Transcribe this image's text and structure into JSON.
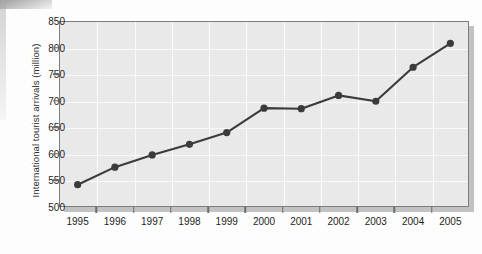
{
  "chart_data": {
    "type": "line",
    "title": "",
    "xlabel": "",
    "ylabel": "International tourist arrivals (million)",
    "categories": [
      "1995",
      "1996",
      "1997",
      "1998",
      "1999",
      "2000",
      "2001",
      "2002",
      "2003",
      "2004",
      "2005"
    ],
    "values": [
      542,
      575,
      598,
      618,
      640,
      686,
      685,
      710,
      699,
      763,
      808
    ],
    "series": [
      {
        "name": "International tourist arrivals",
        "values": [
          542,
          575,
          598,
          618,
          640,
          686,
          685,
          710,
          699,
          763,
          808
        ]
      }
    ],
    "ylim": [
      500,
      850
    ],
    "yticks": [
      500,
      550,
      600,
      650,
      700,
      750,
      800,
      850
    ],
    "ytick_labels": [
      "500",
      "550",
      "600",
      "650",
      "700",
      "750",
      "800",
      "850"
    ],
    "xtick_labels": [
      "1995",
      "1996",
      "1997",
      "1998",
      "1999",
      "2000",
      "2001",
      "2002",
      "2003",
      "2004",
      "2005"
    ],
    "grid": true,
    "legend": false,
    "legend_position": "none",
    "marker": "circle",
    "colors": {
      "line": "#3b3b3b",
      "marker": "#3b3b3b",
      "plot_background": "#e9e9e9",
      "grid": "#fafafa",
      "frame_border": "#7d7d7d",
      "text": "#1d1d1d",
      "page_background": "#fdfdfd"
    }
  }
}
